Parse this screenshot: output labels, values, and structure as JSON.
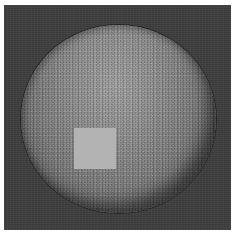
{
  "image": {
    "description": "Grayscale textured sphere on a dark gray square background with a light gray square patch",
    "colors": {
      "page_background": "#ffffff",
      "frame_background": "#3e3e3e",
      "sphere_highlight": "#a4a4a4",
      "sphere_mid": "#7f7f7f",
      "sphere_edge": "#1e1e1e",
      "patch": "#b3b3b3"
    }
  }
}
